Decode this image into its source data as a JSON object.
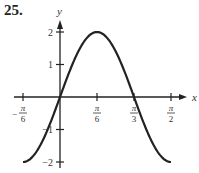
{
  "problem_number": "25.",
  "chart_data": {
    "type": "line",
    "title": "",
    "function": "y = 2 sin(3x)",
    "xlabel": "x",
    "ylabel": "y",
    "x_ticks": [
      "-π/6",
      "π/6",
      "π/3",
      "π/2"
    ],
    "x_tick_values": [
      -0.5236,
      0.5236,
      1.0472,
      1.5708
    ],
    "y_ticks": [
      "2",
      "1",
      "-1",
      "-2"
    ],
    "y_tick_values": [
      2,
      1,
      -1,
      -2
    ],
    "xlim": [
      -0.5236,
      1.5708
    ],
    "ylim": [
      -2,
      2
    ],
    "grid": false,
    "series": [
      {
        "name": "y = 2 sin(3x)",
        "x": [
          -0.5236,
          -0.2618,
          0,
          0.2618,
          0.5236,
          0.7854,
          1.0472,
          1.309,
          1.5708
        ],
        "values": [
          -2,
          -1.414,
          0,
          1.414,
          2,
          1.414,
          0,
          -1.414,
          -2
        ]
      }
    ]
  }
}
